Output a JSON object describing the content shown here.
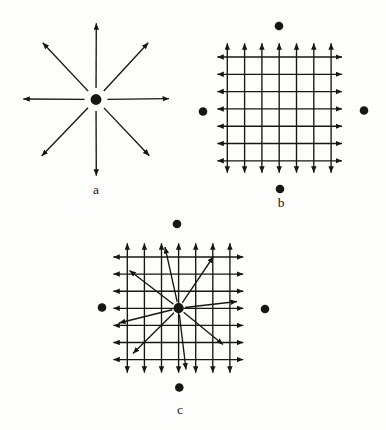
{
  "figure": {
    "background": "#fdfdfc",
    "ink": "#161616",
    "panels": [
      {
        "label": "a",
        "type": "radial-arrows-from-point",
        "center": [
          96,
          99.5
        ],
        "center_dot_r": 5.4,
        "ray_gap": 11.5,
        "rays": [
          [
            96.3,
            23.3
          ],
          [
            148.3,
            42.7
          ],
          [
            169,
            98.7
          ],
          [
            149.3,
            155.7
          ],
          [
            96.3,
            175.7
          ],
          [
            41.7,
            156
          ],
          [
            23.3,
            99
          ],
          [
            42.7,
            42.7
          ]
        ],
        "label_pos": [
          96,
          190
        ]
      },
      {
        "label": "b",
        "type": "grid-of-double-arrows-with-outer-dots",
        "grid": {
          "v_xs": [
            227.3,
            244.6,
            261.9,
            279.2,
            296.5,
            313.8,
            331.1
          ],
          "h_ys": [
            57,
            74.3,
            91.6,
            108.9,
            126.2,
            143.5,
            160.8
          ],
          "v_ext": [
            43.3,
            172.7
          ],
          "h_ext": [
            217.3,
            342
          ]
        },
        "dots": [
          [
            279,
            26
          ],
          [
            364,
            110.5
          ],
          [
            280,
            189
          ],
          [
            203,
            111.5
          ]
        ],
        "dot_r": 4.3,
        "label_pos": [
          281,
          203
        ]
      },
      {
        "label": "c",
        "type": "grid-with-skewed-radial-arrows-and-outer-dots",
        "grid": {
          "v_xs": [
            127.3,
            144.4,
            161.5,
            178.6,
            195.7,
            212.8,
            229.9
          ],
          "h_ys": [
            257,
            274.1,
            291.2,
            308.3,
            325.4,
            342.5,
            359.6
          ],
          "v_ext": [
            243.3,
            372.7
          ],
          "h_ext": [
            113.3,
            243.3
          ]
        },
        "dots": [
          [
            177,
            224
          ],
          [
            265,
            309
          ],
          [
            179.3,
            387.5
          ],
          [
            102,
            307.5
          ]
        ],
        "dot_r": 4.3,
        "center": [
          178.6,
          308.2
        ],
        "center_dot_r": 5.1,
        "ray_gap": 6.5,
        "rays": [
          [
            165,
            247
          ],
          [
            213.5,
            256.5
          ],
          [
            237,
            301.5
          ],
          [
            223,
            344.5
          ],
          [
            186,
            369.5
          ],
          [
            133,
            353.5
          ],
          [
            119,
            323
          ],
          [
            129.5,
            270.5
          ]
        ],
        "label_pos": [
          180,
          410
        ]
      }
    ]
  }
}
